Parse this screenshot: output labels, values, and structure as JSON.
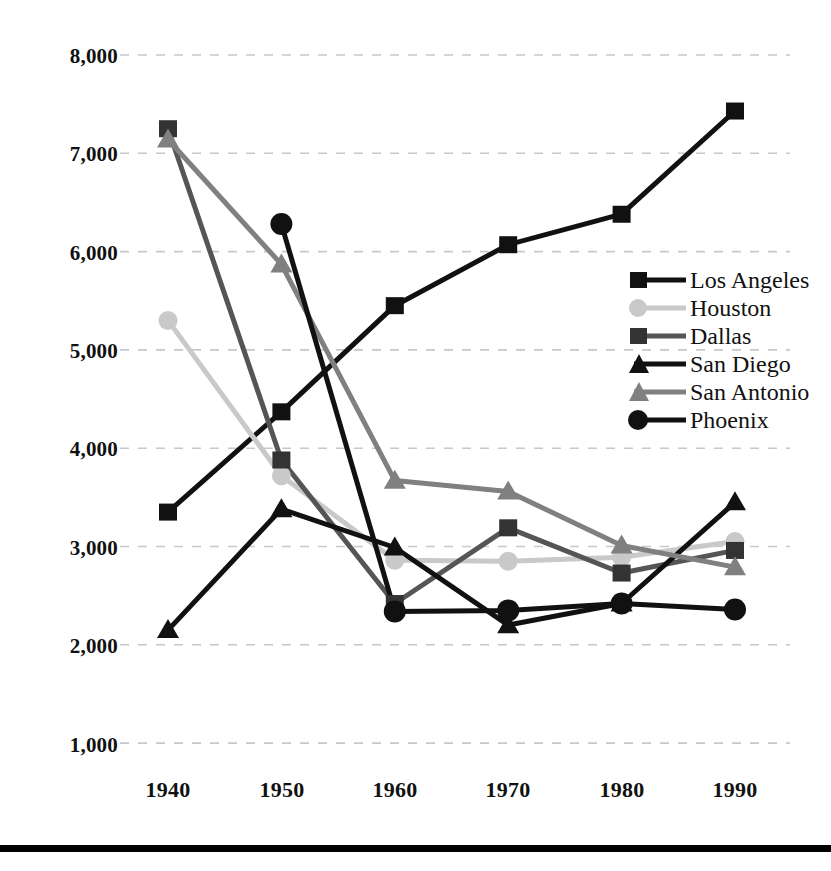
{
  "chart_data": {
    "type": "line",
    "title": "",
    "subtitle": "",
    "xlabel": "",
    "ylabel": "",
    "categories": [
      "1940",
      "1950",
      "1960",
      "1970",
      "1980",
      "1990"
    ],
    "x": [
      1940,
      1950,
      1960,
      1970,
      1980,
      1990
    ],
    "ylim": [
      1000,
      8000
    ],
    "yticks": [
      1000,
      2000,
      3000,
      4000,
      5000,
      6000,
      7000,
      8000
    ],
    "ytick_labels": [
      "1,000",
      "2,000",
      "3,000",
      "4,000",
      "5,000",
      "6,000",
      "7,000",
      "8,000"
    ],
    "grid": "horizontal-dashed",
    "legend_position": "inside-right",
    "series": [
      {
        "name": "Los Angeles",
        "color": "#111111",
        "marker": "square",
        "values": [
          3350,
          4370,
          5450,
          6070,
          6380,
          7430
        ]
      },
      {
        "name": "Houston",
        "color": "#c9c9c9",
        "marker": "circle",
        "values": [
          5300,
          3720,
          2860,
          2850,
          2890,
          3050
        ]
      },
      {
        "name": "Dallas",
        "color": "#555555",
        "marker": "square",
        "values": [
          7250,
          3880,
          2420,
          3190,
          2730,
          2960
        ]
      },
      {
        "name": "San Diego",
        "color": "#111111",
        "marker": "triangle",
        "values": [
          2150,
          3380,
          2990,
          2200,
          2420,
          3450
        ]
      },
      {
        "name": "San Antonio",
        "color": "#808080",
        "marker": "triangle",
        "values": [
          7140,
          5870,
          3670,
          3560,
          3010,
          2790
        ]
      },
      {
        "name": "Phoenix",
        "color": "#111111",
        "marker": "circle",
        "values": [
          null,
          6280,
          2340,
          2350,
          2420,
          2360
        ]
      }
    ],
    "annotations": []
  },
  "axis": {
    "y_tick_labels": [
      "8,000",
      "7,000",
      "6,000",
      "5,000",
      "4,000",
      "3,000",
      "2,000",
      "1,000"
    ],
    "x_tick_labels": [
      "1940",
      "1950",
      "1960",
      "1970",
      "1980",
      "1990"
    ]
  },
  "legend": {
    "items": [
      {
        "label": "Los Angeles"
      },
      {
        "label": "Houston"
      },
      {
        "label": "Dallas"
      },
      {
        "label": "San Diego"
      },
      {
        "label": "San Antonio"
      },
      {
        "label": "Phoenix"
      }
    ]
  }
}
